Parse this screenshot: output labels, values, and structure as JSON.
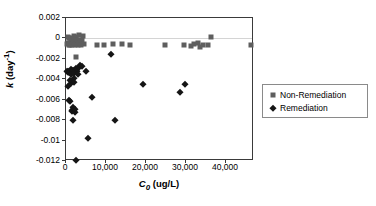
{
  "chart_data": {
    "type": "scatter",
    "title": "",
    "xlabel": "C0 (ug/L)",
    "ylabel": "k (day-1)",
    "xlim": [
      0,
      47000
    ],
    "ylim": [
      -0.012,
      0.002
    ],
    "grid": false,
    "legend_position": "right",
    "xticks": [
      0,
      10000,
      20000,
      30000,
      40000
    ],
    "xtick_labels": [
      "0",
      "10,000",
      "20,000",
      "30,000",
      "40,000"
    ],
    "yticks": [
      0.002,
      0,
      -0.002,
      -0.004,
      -0.006,
      -0.008,
      -0.01,
      -0.012
    ],
    "ytick_labels": [
      "0.002",
      "0",
      "-0.002",
      "-0.004",
      "-0.006",
      "-0.008",
      "-0.01",
      "-0.012"
    ],
    "series": [
      {
        "name": "Non-Remediation",
        "marker": "square",
        "color": "#5e5e5e",
        "points": [
          [
            350,
            -0.00055
          ],
          [
            500,
            0.00012
          ],
          [
            620,
            -0.0004
          ],
          [
            700,
            -0.00065
          ],
          [
            850,
            2e-05
          ],
          [
            950,
            -0.00048
          ],
          [
            1050,
            -0.00062
          ],
          [
            1200,
            5e-05
          ],
          [
            1350,
            -0.0003
          ],
          [
            1500,
            -0.0006
          ],
          [
            1650,
            -0.0001
          ],
          [
            1800,
            -0.00055
          ],
          [
            1950,
            0.0002
          ],
          [
            2100,
            -0.00035
          ],
          [
            2250,
            -0.0006
          ],
          [
            2400,
            -8e-05
          ],
          [
            2600,
            0.00015
          ],
          [
            2750,
            -0.0005
          ],
          [
            2900,
            -0.00062
          ],
          [
            3100,
            -0.0002
          ],
          [
            3300,
            0.0003
          ],
          [
            3500,
            -0.00045
          ],
          [
            3700,
            -0.0006
          ],
          [
            3950,
            -0.00015
          ],
          [
            4300,
            0.00022
          ],
          [
            4600,
            -0.0005
          ],
          [
            2600,
            -0.0018
          ],
          [
            7800,
            -0.00062
          ],
          [
            9500,
            -0.0006
          ],
          [
            11800,
            -0.00058
          ],
          [
            14000,
            -0.00055
          ],
          [
            16100,
            -0.00062
          ],
          [
            24800,
            -0.00062
          ],
          [
            29600,
            -0.0006
          ],
          [
            31200,
            -0.00075
          ],
          [
            32100,
            -0.00055
          ],
          [
            33000,
            -0.0004
          ],
          [
            33600,
            -0.00085
          ],
          [
            34300,
            -0.00062
          ],
          [
            35500,
            -0.00065
          ],
          [
            36200,
            0.00015
          ],
          [
            46300,
            -0.00068
          ]
        ]
      },
      {
        "name": "Remediation",
        "marker": "diamond",
        "color": "#151515",
        "points": [
          [
            300,
            -0.0032
          ],
          [
            400,
            -0.0033
          ],
          [
            450,
            -0.0047
          ],
          [
            600,
            -0.00315
          ],
          [
            700,
            -0.00325
          ],
          [
            800,
            -0.006
          ],
          [
            900,
            -0.0061
          ],
          [
            1000,
            -0.0033
          ],
          [
            1100,
            -0.0041
          ],
          [
            1200,
            -0.00345
          ],
          [
            1250,
            -0.003
          ],
          [
            1300,
            -0.0044
          ],
          [
            1400,
            -0.0042
          ],
          [
            1500,
            -0.007
          ],
          [
            1600,
            -0.0071
          ],
          [
            1700,
            -0.0067
          ],
          [
            1750,
            -0.008
          ],
          [
            1850,
            -0.00305
          ],
          [
            1900,
            -0.0039
          ],
          [
            2000,
            -0.0043
          ],
          [
            2100,
            -0.00335
          ],
          [
            2200,
            -0.00725
          ],
          [
            2300,
            -0.0069
          ],
          [
            2400,
            -0.00285
          ],
          [
            2500,
            -0.0119
          ],
          [
            2700,
            -0.0032
          ],
          [
            2850,
            -0.00295
          ],
          [
            3000,
            -0.00345
          ],
          [
            3300,
            -0.00275
          ],
          [
            3600,
            -0.00265
          ],
          [
            4000,
            -0.0027
          ],
          [
            5000,
            -0.00315
          ],
          [
            5600,
            -0.00975
          ],
          [
            6400,
            -0.00575
          ],
          [
            11300,
            -0.00155
          ],
          [
            12300,
            -0.008
          ],
          [
            19300,
            -0.00445
          ],
          [
            28500,
            -0.0052
          ],
          [
            29700,
            -0.00445
          ]
        ]
      }
    ]
  }
}
